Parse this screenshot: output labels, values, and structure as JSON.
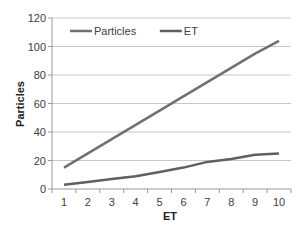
{
  "chart_data": {
    "type": "line",
    "title": "",
    "xlabel": "ET",
    "ylabel": "Particles",
    "categories": [
      1,
      2,
      3,
      4,
      5,
      6,
      7,
      8,
      9,
      10
    ],
    "ylim": [
      0,
      120
    ],
    "yticks": [
      0,
      20,
      40,
      60,
      80,
      100,
      120
    ],
    "grid": true,
    "legend_position": "top-inside",
    "series": [
      {
        "name": "Particles",
        "color": "#707070",
        "values": [
          15,
          25,
          35,
          45,
          55,
          65,
          75,
          85,
          95,
          104
        ]
      },
      {
        "name": "ET",
        "color": "#606060",
        "values": [
          3,
          5,
          7,
          9,
          12,
          15,
          19,
          21,
          24,
          25
        ]
      }
    ]
  },
  "colors": {
    "grid": "#c8c8c8",
    "axis": "#9a9a9a",
    "background": "#ffffff"
  }
}
